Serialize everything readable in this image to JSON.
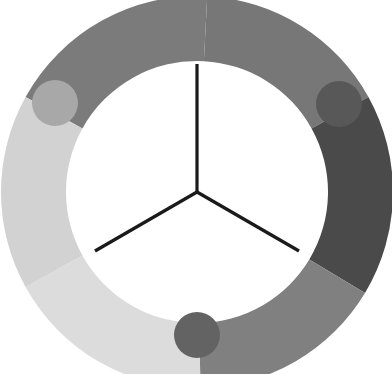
{
  "canvas": {
    "width": 392,
    "height": 374,
    "background": "#ffffff",
    "title": "three-segment-hub-and-spoke-wheel-diagram"
  },
  "hub": {
    "center_x": 197,
    "center_y": 192,
    "spoke_color": "#1a1a1a",
    "spoke_width": 3.2,
    "spokes": [
      {
        "name": "spoke-up",
        "angle_deg": -90,
        "length": 128,
        "end_x": 197,
        "end_y": 64
      },
      {
        "name": "spoke-lower-left",
        "angle_deg": 150,
        "length": 118,
        "end_x": 95,
        "end_y": 251
      },
      {
        "name": "spoke-lower-right",
        "angle_deg": 30,
        "length": 118,
        "end_x": 299,
        "end_y": 251
      }
    ]
  },
  "ring": {
    "outer_radius": 196,
    "inner_radius": 131,
    "segment_count": 6,
    "gap_deg": 5
  },
  "segments": [
    {
      "id": "segment-top-left",
      "label": "top-left-arc",
      "color": "#7b7b7b",
      "start_deg": -87,
      "end_deg": -151,
      "shade": "medium"
    },
    {
      "id": "segment-top-right",
      "label": "top-right-arc",
      "color": "#777777",
      "start_deg": -29,
      "end_deg": -87,
      "shade": "medium"
    },
    {
      "id": "segment-right",
      "label": "right-arc",
      "color": "#4a4a4a",
      "start_deg": 31,
      "end_deg": -29,
      "shade": "dark"
    },
    {
      "id": "segment-bottom-right",
      "label": "bottom-right-arc",
      "color": "#808080",
      "start_deg": 89,
      "end_deg": 31,
      "shade": "medium"
    },
    {
      "id": "segment-bottom-left",
      "label": "bottom-left-arc",
      "color": "#dcdcdc",
      "start_deg": 151,
      "end_deg": 89,
      "shade": "very-light"
    },
    {
      "id": "segment-left",
      "label": "left-arc",
      "color": "#d2d2d2",
      "start_deg": 209,
      "end_deg": 151,
      "shade": "light"
    }
  ],
  "nodes": [
    {
      "id": "node-top-left",
      "label": "top-left-circle",
      "cx": 55,
      "cy": 103,
      "r": 23,
      "color": "#a8a8a8",
      "shade": "light-medium"
    },
    {
      "id": "node-top-right",
      "label": "top-right-circle",
      "cx": 339,
      "cy": 104,
      "r": 23,
      "color": "#585858",
      "shade": "dark"
    },
    {
      "id": "node-bottom",
      "label": "bottom-circle",
      "cx": 197,
      "cy": 335,
      "r": 23,
      "color": "#636363",
      "shade": "medium-dark"
    }
  ]
}
